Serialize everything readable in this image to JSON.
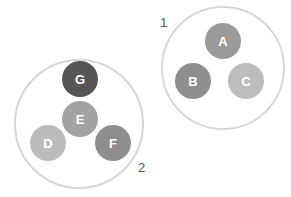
{
  "diagram": {
    "groups": [
      {
        "id": "group-1",
        "label": "1",
        "cx": 223,
        "cy": 68,
        "r": 61,
        "label_x": 160,
        "label_y": 27,
        "nodes": [
          {
            "label": "A",
            "cx": 223,
            "cy": 41,
            "r": 18,
            "color": "#9a9a9a"
          },
          {
            "label": "B",
            "cx": 193,
            "cy": 81,
            "r": 18,
            "color": "#8e8e8e"
          },
          {
            "label": "C",
            "cx": 246,
            "cy": 81,
            "r": 18,
            "color": "#bdbdbd"
          }
        ]
      },
      {
        "id": "group-2",
        "label": "2",
        "cx": 79,
        "cy": 124,
        "r": 64,
        "label_x": 138,
        "label_y": 172,
        "nodes": [
          {
            "label": "G",
            "cx": 80,
            "cy": 79,
            "r": 18,
            "color": "#555555"
          },
          {
            "label": "E",
            "cx": 80,
            "cy": 119,
            "r": 18,
            "color": "#a3a3a3"
          },
          {
            "label": "D",
            "cx": 48,
            "cy": 143,
            "r": 18,
            "color": "#bcbcbc"
          },
          {
            "label": "F",
            "cx": 113,
            "cy": 143,
            "r": 18,
            "color": "#8e8e8e"
          }
        ]
      }
    ],
    "colors": {
      "group_outline": "#d6d6d6",
      "node_text": "#ffffff",
      "group_label": "#555555"
    }
  }
}
